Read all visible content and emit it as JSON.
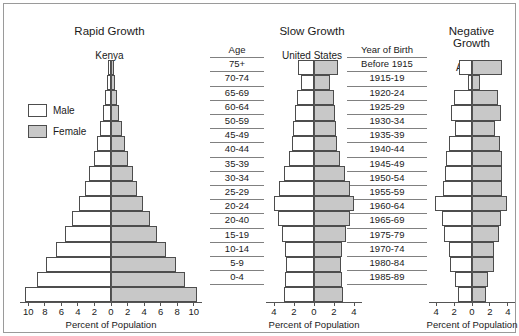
{
  "panels": [
    {
      "title": "Rapid Growth",
      "subtitle": "Kenya"
    },
    {
      "title": "Slow Growth",
      "subtitle": "United States"
    },
    {
      "title": "Negative\nGrowth",
      "subtitle": "Austria"
    }
  ],
  "legend": {
    "male_label": "Male",
    "female_label": "Female",
    "male_color": "#ffffff",
    "female_color": "#c8c8c8"
  },
  "age_header": "Age",
  "age_labels": [
    "75+",
    "70-74",
    "65-69",
    "60-64",
    "50-59",
    "45-49",
    "40-44",
    "35-39",
    "30-34",
    "25-29",
    "20-24",
    "20-40",
    "15-19",
    "10-14",
    "5-9",
    "0-4"
  ],
  "year_header": "Year of Birth",
  "year_labels": [
    "Before 1915",
    "1915-19",
    "1920-24",
    "1925-29",
    "1930-34",
    "1935-39",
    "1940-44",
    "1945-49",
    "1950-54",
    "1955-59",
    "1960-64",
    "1965-69",
    "1975-79",
    "1970-74",
    "1980-84",
    "1985-89"
  ],
  "axis_caption": "Percent of Population",
  "chart_data": [
    {
      "type": "bar",
      "title": "Rapid Growth",
      "subtitle": "Kenya",
      "orientation": "population-pyramid",
      "categories": [
        "75+",
        "70-74",
        "65-69",
        "60-64",
        "50-59",
        "45-49",
        "40-44",
        "35-39",
        "30-34",
        "25-29",
        "20-24",
        "20-40",
        "15-19",
        "10-14",
        "5-9",
        "0-4"
      ],
      "series": [
        {
          "name": "Male",
          "values": [
            0.35,
            0.5,
            0.75,
            1.0,
            1.3,
            1.7,
            2.1,
            2.6,
            3.2,
            3.9,
            4.7,
            5.6,
            6.6,
            7.8,
            9.0,
            10.4
          ]
        },
        {
          "name": "Female",
          "values": [
            0.35,
            0.5,
            0.75,
            1.0,
            1.3,
            1.7,
            2.1,
            2.6,
            3.2,
            3.9,
            4.7,
            5.6,
            6.6,
            7.8,
            9.0,
            10.4
          ]
        }
      ],
      "xlabel": "Percent of Population",
      "ylabel": "Age",
      "xticks": [
        10,
        8,
        6,
        4,
        2,
        0,
        2,
        4,
        6,
        8,
        10
      ],
      "xlim": [
        -11,
        11
      ],
      "grid": false,
      "legend_position": "left"
    },
    {
      "type": "bar",
      "title": "Slow Growth",
      "subtitle": "United States",
      "orientation": "population-pyramid",
      "categories": [
        "75+",
        "70-74",
        "65-69",
        "60-64",
        "50-59",
        "45-49",
        "40-44",
        "35-39",
        "30-34",
        "25-29",
        "20-24",
        "20-40",
        "15-19",
        "10-14",
        "5-9",
        "0-4"
      ],
      "series": [
        {
          "name": "Male",
          "values": [
            1.6,
            1.3,
            1.7,
            1.9,
            2.1,
            2.2,
            2.5,
            3.0,
            3.5,
            4.0,
            3.6,
            3.2,
            2.9,
            2.8,
            2.9,
            3.0
          ]
        },
        {
          "name": "Female",
          "values": [
            2.4,
            1.6,
            2.0,
            2.1,
            2.2,
            2.3,
            2.6,
            3.1,
            3.6,
            4.0,
            3.6,
            3.2,
            2.8,
            2.7,
            2.8,
            2.9
          ]
        }
      ],
      "xlabel": "Percent of Population",
      "xticks": [
        4,
        2,
        0,
        2,
        4
      ],
      "xlim": [
        -4.8,
        4.8
      ],
      "grid": false
    },
    {
      "type": "bar",
      "title": "Negative Growth",
      "subtitle": "Austria",
      "orientation": "population-pyramid",
      "categories": [
        "75+",
        "70-74",
        "65-69",
        "60-64",
        "50-59",
        "45-49",
        "40-44",
        "35-39",
        "30-34",
        "25-29",
        "20-24",
        "20-40",
        "15-19",
        "10-14",
        "5-9",
        "0-4"
      ],
      "series": [
        {
          "name": "Male",
          "values": [
            1.5,
            0.5,
            2.0,
            2.4,
            1.9,
            2.6,
            2.9,
            3.0,
            3.2,
            4.1,
            3.3,
            3.1,
            2.6,
            2.5,
            1.9,
            1.6
          ]
        },
        {
          "name": "Female",
          "values": [
            3.4,
            0.9,
            2.9,
            3.2,
            2.6,
            3.1,
            3.3,
            3.3,
            3.4,
            3.9,
            3.2,
            3.0,
            2.5,
            2.4,
            1.8,
            1.6
          ]
        }
      ],
      "xlabel": "Percent of Population",
      "xticks": [
        4,
        2,
        0,
        2,
        4
      ],
      "xlim": [
        -4.8,
        4.8
      ],
      "grid": false
    }
  ]
}
